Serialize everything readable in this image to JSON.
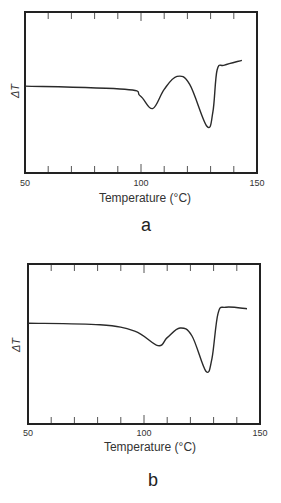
{
  "chart_data": [
    {
      "type": "line",
      "panel": "a",
      "title": "",
      "xlabel": "Temperature (°C)",
      "ylabel": "ΔT",
      "xlim": [
        50,
        150
      ],
      "ylim": [
        0,
        100
      ],
      "x_ticks": [
        50,
        60,
        70,
        80,
        90,
        100,
        110,
        120,
        130,
        140,
        150
      ],
      "x_tick_labels": [
        "50",
        "100",
        "150"
      ],
      "grid": false,
      "legend": null,
      "series": [
        {
          "name": "DTA curve a",
          "x": [
            50,
            93,
            99.6,
            105,
            110,
            115.5,
            121,
            128.4,
            131,
            132.8,
            136,
            143.5
          ],
          "y": [
            54,
            52,
            48,
            40,
            52,
            60,
            55,
            29,
            38,
            64,
            67,
            70
          ]
        }
      ],
      "annotations": [
        "endotherm minimum ~105 °C",
        "endotherm minimum ~128 °C"
      ]
    },
    {
      "type": "line",
      "panel": "b",
      "title": "",
      "xlabel": "Temperature (°C)",
      "ylabel": "ΔT",
      "xlim": [
        50,
        150
      ],
      "ylim": [
        0,
        100
      ],
      "x_ticks": [
        50,
        60,
        70,
        80,
        90,
        100,
        110,
        120,
        130,
        140,
        150
      ],
      "x_tick_labels": [
        "50",
        "100",
        "150"
      ],
      "grid": false,
      "legend": null,
      "series": [
        {
          "name": "DTA curve b",
          "x": [
            50,
            81,
            96,
            106,
            110,
            115.5,
            120.7,
            126.7,
            129.3,
            131.9,
            135.3,
            144.4
          ],
          "y": [
            63,
            62,
            58,
            49,
            54,
            60,
            55,
            33,
            41,
            69,
            73,
            72
          ]
        }
      ],
      "annotations": [
        "endotherm minimum ~106 °C",
        "endotherm minimum ~127 °C"
      ]
    }
  ],
  "panels": [
    {
      "id": "a",
      "label": "a",
      "ylabel": "ΔT",
      "xlabel": "Temperature (°C)",
      "tick_labels": [
        "50",
        "100",
        "150"
      ]
    },
    {
      "id": "b",
      "label": "b",
      "ylabel": "ΔT",
      "xlabel": "Temperature (°C)",
      "tick_labels": [
        "50",
        "100",
        "150"
      ]
    }
  ],
  "style": {
    "line_color": "#2a2a2a",
    "frame_color": "#222222",
    "tick_color": "#555555"
  }
}
